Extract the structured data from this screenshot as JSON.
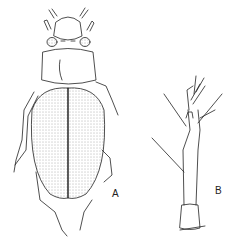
{
  "figure": {
    "panels": [
      {
        "label": "A",
        "subject": "beetle dorsal view"
      },
      {
        "label": "B",
        "subject": "antenna / appendage segment"
      }
    ],
    "colors": {
      "ink": "#222222",
      "background": "#ffffff"
    }
  }
}
